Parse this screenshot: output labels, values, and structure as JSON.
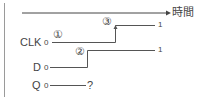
{
  "diagram": {
    "type": "timing-diagram",
    "time_axis": {
      "label": "時間"
    },
    "signals": [
      {
        "name": "CLK",
        "initial": "0",
        "final": "1",
        "edge_marker": "③",
        "start_marker": "①"
      },
      {
        "name": "D",
        "initial": "0",
        "final": "1",
        "edge_marker": "②"
      },
      {
        "name": "Q",
        "initial": "0",
        "final": "?"
      }
    ]
  },
  "labels": {
    "time": "時間",
    "clk_name": "CLK",
    "clk_zero": "0",
    "clk_one": "1",
    "marker1": "①",
    "marker2": "②",
    "marker3": "③",
    "d_name": "D",
    "d_zero": "0",
    "d_one": "1",
    "q_name": "Q",
    "q_zero": "0",
    "q_unknown": "?"
  },
  "colors": {
    "line": "#555555",
    "border": "#9a9a9a",
    "text": "#444444"
  }
}
